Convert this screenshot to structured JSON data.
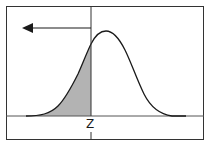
{
  "diagram": {
    "type": "normal-distribution-left-tail",
    "z_label": "Z",
    "shaded_region": "left tail area under curve, from -infinity to z",
    "arrow_direction": "left",
    "colors": {
      "frame": "#333333",
      "curve": "#1a1a1a",
      "shade": "#b3b3b3",
      "background": "#ffffff"
    }
  }
}
